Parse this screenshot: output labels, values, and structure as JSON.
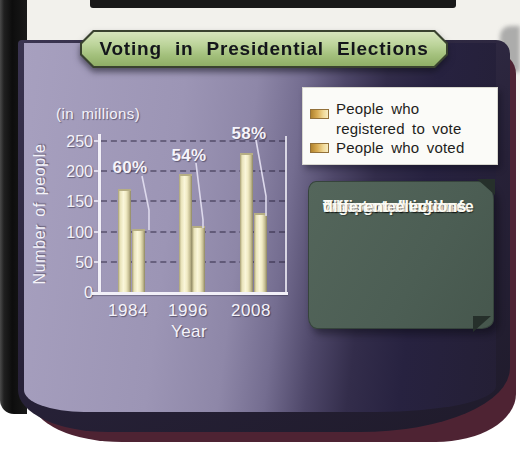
{
  "banner": {
    "title": "Voting in Presidential Elections"
  },
  "chart": {
    "units_label": "(in millions)",
    "y_axis_title": "Number of people",
    "x_axis_title": "Year"
  },
  "chart_data": {
    "type": "bar",
    "title": "Voting in Presidential Elections",
    "categories": [
      "1984",
      "1996",
      "2008"
    ],
    "series": [
      {
        "name": "People who registered to vote",
        "values": [
          170,
          195,
          230
        ]
      },
      {
        "name": "People who voted",
        "values": [
          105,
          110,
          130
        ]
      }
    ],
    "point_labels": {
      "series": "People who voted",
      "labels": [
        "60%",
        "54%",
        "58%"
      ]
    },
    "xlabel": "Year",
    "ylabel": "Number of people",
    "units": "millions",
    "ylim": [
      0,
      250
    ],
    "ytick_step": 50,
    "grid": true,
    "legend_position": "top-right"
  },
  "legend": {
    "item1_line1": "People who",
    "item1_line2": "registered to vote",
    "item2": "People who voted"
  },
  "callout": {
    "line1": "This graph shows",
    "line2": "the percentage of",
    "line3": "registered voters",
    "line4": "who voted in three",
    "line5": "different elections."
  },
  "colors": {
    "banner_green": "#a3c07c",
    "panel_light": "#a7a0bf",
    "panel_dark": "#241f35",
    "bar_fill": "#faf6da",
    "legend_swatch": "#d9ad55",
    "callout_bg": "#4c5e54",
    "maroon_edge": "#4e2333"
  }
}
